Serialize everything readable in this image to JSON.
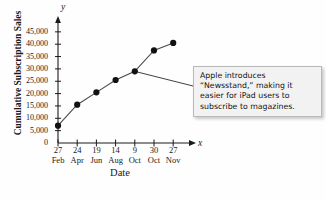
{
  "chart_data": {
    "type": "line",
    "title": "",
    "xlabel": "Date",
    "ylabel": "Cumulative Subscription Sales",
    "x_axis_variable": "x",
    "y_axis_variable": "y",
    "grid": false,
    "legend": "none",
    "ylim": [
      0,
      47000
    ],
    "yticks": [
      0,
      5000,
      10000,
      15000,
      20000,
      25000,
      30000,
      35000,
      40000,
      45000
    ],
    "ytick_labels": [
      "0",
      "5,000",
      "10,000",
      "15,000",
      "20,000",
      "25,000",
      "30,000",
      "35,000",
      "40,000",
      "45,000"
    ],
    "categories": [
      "27 Feb",
      "24 Apr",
      "19 Jun",
      "14 Aug",
      "9 Oct",
      "30 Oct",
      "27 Nov"
    ],
    "xtick_days": [
      "27",
      "24",
      "19",
      "14",
      "9",
      "30",
      "27"
    ],
    "xtick_months": [
      "Feb",
      "Apr",
      "Jun",
      "Aug",
      "Oct",
      "Oct",
      "Nov"
    ],
    "values": [
      7000,
      15500,
      20500,
      25500,
      29000,
      37500,
      40500
    ],
    "marker": "filled-circle",
    "annotations": [
      {
        "text": "Apple introduces “Newsstand,” making it easier for iPad users to subscribe to magazines.",
        "anchor_category": "9 Oct",
        "anchor_value": 29000,
        "leader_line": true
      }
    ]
  },
  "callout": {
    "line1": "Apple introduces",
    "line2": "“Newsstand,” making it",
    "line3": "easier for iPad users to",
    "line4": "subscribe to magazines.",
    "text": "Apple introduces “Newsstand,” making it easier for iPad users to subscribe to magazines.",
    "background": "#f2f2f2",
    "border_color": "#b9b9b9"
  },
  "colors": {
    "background": "#fefefe",
    "axis": "#1a1a1a",
    "line": "#4a4a4a",
    "marker": "#111111"
  }
}
